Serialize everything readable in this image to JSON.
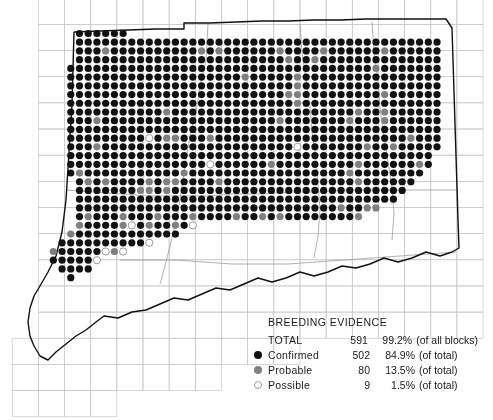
{
  "figure": {
    "kind": "distribution-dot-map",
    "region": "Connecticut",
    "colors": {
      "confirmed": "#111111",
      "probable": "#808080",
      "possible_fill": "#ffffff",
      "possible_stroke": "#9a9a9a",
      "block_grid": "#c9c9c9",
      "county_line": "#9d9d9d",
      "state_boundary": "#111111",
      "background": "#ffffff"
    },
    "geometry": {
      "dot_radius": 3.6,
      "dot_spacing_x": 8.72,
      "dot_spacing_y": 8.72,
      "dot_origin_x": 79.5,
      "dot_origin_y": 33.5,
      "block_size": 26.16,
      "block_origin_x": 38.0,
      "block_origin_y": 24.0,
      "block_cols": 17,
      "block_rows": 15
    }
  },
  "legend": {
    "title": "BREEDING EVIDENCE",
    "rows": [
      {
        "marker": "none",
        "label": "TOTAL",
        "count": "591",
        "percent": "99.2%",
        "note": "(of all blocks)"
      },
      {
        "marker": "confirmed",
        "label": "Confirmed",
        "count": "502",
        "percent": "84.9%",
        "note": "(of total)"
      },
      {
        "marker": "probable",
        "label": "Probable",
        "count": "80",
        "percent": "13.5%",
        "note": "(of total)"
      },
      {
        "marker": "possible",
        "label": "Possible",
        "count": "9",
        "percent": "1.5%",
        "note": "(of total)"
      }
    ]
  },
  "chart_data": {
    "type": "map",
    "title": "BREEDING EVIDENCE",
    "categories": [
      "Confirmed",
      "Probable",
      "Possible"
    ],
    "values": [
      502,
      80,
      9
    ],
    "percentages": [
      84.9,
      13.5,
      1.5
    ],
    "total_blocks_occupied": 591,
    "total_percent_of_all_blocks": 99.2,
    "legend_position": "bottom-right",
    "grid": true,
    "state_outline_path": [
      [
        74,
        32
      ],
      [
        100,
        31
      ],
      [
        128,
        30
      ],
      [
        156,
        29
      ],
      [
        184,
        29
      ],
      [
        184,
        23
      ],
      [
        210,
        23
      ],
      [
        236,
        22
      ],
      [
        262,
        21
      ],
      [
        288,
        21
      ],
      [
        314,
        20
      ],
      [
        340,
        20
      ],
      [
        366,
        19
      ],
      [
        392,
        19
      ],
      [
        420,
        19
      ],
      [
        446,
        19
      ],
      [
        452,
        28
      ],
      [
        453,
        60
      ],
      [
        454,
        92
      ],
      [
        455,
        124
      ],
      [
        456,
        156
      ],
      [
        457,
        188
      ],
      [
        458,
        220
      ],
      [
        459,
        248
      ],
      [
        452,
        252
      ],
      [
        440,
        256
      ],
      [
        426,
        252
      ],
      [
        412,
        258
      ],
      [
        398,
        262
      ],
      [
        384,
        258
      ],
      [
        370,
        264
      ],
      [
        356,
        268
      ],
      [
        342,
        266
      ],
      [
        328,
        272
      ],
      [
        314,
        276
      ],
      [
        300,
        272
      ],
      [
        286,
        278
      ],
      [
        272,
        282
      ],
      [
        258,
        278
      ],
      [
        244,
        284
      ],
      [
        230,
        290
      ],
      [
        216,
        288
      ],
      [
        202,
        294
      ],
      [
        188,
        300
      ],
      [
        174,
        298
      ],
      [
        160,
        304
      ],
      [
        146,
        310
      ],
      [
        132,
        312
      ],
      [
        118,
        318
      ],
      [
        104,
        316
      ],
      [
        96,
        322
      ],
      [
        86,
        330
      ],
      [
        76,
        336
      ],
      [
        66,
        344
      ],
      [
        56,
        352
      ],
      [
        48,
        360
      ],
      [
        40,
        356
      ],
      [
        34,
        346
      ],
      [
        30,
        336
      ],
      [
        28,
        322
      ],
      [
        30,
        308
      ],
      [
        34,
        296
      ],
      [
        40,
        286
      ],
      [
        48,
        272
      ],
      [
        56,
        256
      ],
      [
        62,
        232
      ],
      [
        66,
        200
      ],
      [
        68,
        168
      ],
      [
        70,
        136
      ],
      [
        72,
        104
      ],
      [
        73,
        68
      ],
      [
        74,
        32
      ]
    ],
    "dot_rows": [
      {
        "y": 0,
        "runs": [
          {
            "x": 0,
            "codes": "CCCCCC"
          }
        ]
      },
      {
        "y": 1,
        "runs": [
          {
            "x": 0,
            "codes": "CCCCCCCCCCCCCCCCCCCCCCCCCCCCCCCCCCCCCCCCCC"
          }
        ]
      },
      {
        "y": 2,
        "runs": [
          {
            "x": 0,
            "codes": "CCCPCCCCCCCCCCPCPCCCCCCPCCCCPCCCCCCPCCCCCC"
          }
        ]
      },
      {
        "y": 3,
        "runs": [
          {
            "x": 0,
            "codes": "CCCCCCCCCCCCCCCCCCCCCCCCPCCPCCCCCCCCCCCCCC"
          }
        ]
      },
      {
        "y": 4,
        "runs": [
          {
            "x": -1,
            "codes": "CCCCCCCCCCCCCCCCCCCCCCCCCCCCCCCCCCCPCCCCCCC"
          }
        ]
      },
      {
        "y": 5,
        "runs": [
          {
            "x": -1,
            "codes": "CCCCCCCCCCCCCCCCCCCCPCCCCCPCCCCCCCCCCCCCCCC"
          }
        ]
      },
      {
        "y": 6,
        "runs": [
          {
            "x": -1,
            "codes": "CCCCCCCCCCCCCCCCCCCCCCCCCCPCCCCCCCCCCCCCCCC"
          }
        ]
      },
      {
        "y": 7,
        "runs": [
          {
            "x": -1,
            "codes": "CCCCCCCCCCCCCCCCCCCCCCCCCPPCCCCCCCCCPCCCCCC"
          }
        ]
      },
      {
        "y": 8,
        "runs": [
          {
            "x": -1,
            "codes": "CCCCCCCCCCCCCCCCCCCCCCCCCCPCCCCCCCCCCCCCCCC"
          }
        ]
      },
      {
        "y": 9,
        "runs": [
          {
            "x": -1,
            "codes": "CCCCCCCCCCCPCCCCCCCCCCCCCCCCCCCCCPCCPCCCCCC"
          }
        ]
      },
      {
        "y": 10,
        "runs": [
          {
            "x": -1,
            "codes": "CCCPCCCCCCCCCCCCCCCCCCCCPCCCCCCCPCCCPCCCCCC"
          }
        ]
      },
      {
        "y": 11,
        "runs": [
          {
            "x": -1,
            "codes": "CCCCCCCCCCCCCCCCCCCCCCCCCCCCCCCCCCCCCCCCCCC"
          }
        ]
      },
      {
        "y": 12,
        "runs": [
          {
            "x": -1,
            "codes": "CCCCCCCCCOCPPCCCPCCCCCCCCCCCCCCCCCCCCCCPCCC"
          }
        ]
      },
      {
        "y": 13,
        "runs": [
          {
            "x": -1,
            "codes": "CCCPCCCCCCCCCCCCCCCCCCCCCCOCCCCCCCPCCPCCCCC"
          }
        ]
      },
      {
        "y": 14,
        "runs": [
          {
            "x": -1,
            "codes": "CCCCCCCCCCCCCCCCCCCCCCCCCCCCCCCCCCCCCCCCCC"
          }
        ]
      },
      {
        "y": 15,
        "runs": [
          {
            "x": -1,
            "codes": "CCCCCCCCCCCCCCCCOCCCCCCPCCCCCCCCCPCCCCCCPC"
          }
        ]
      },
      {
        "y": 16,
        "runs": [
          {
            "x": -1,
            "codes": "CPCCCCCCCCCCCPCCCCCCCCCCCCCCCCCCPCCCCCCCC"
          }
        ]
      },
      {
        "y": 17,
        "runs": [
          {
            "x": 0,
            "codes": "CPCPCCCCPCPPCCCCPCCCCCCCCCCCCCCCPCCCCCC"
          }
        ]
      },
      {
        "y": 18,
        "runs": [
          {
            "x": 0,
            "codes": "CCCCCCCPPCPCCCCCCCCCCCCCCCCCCCCCCCCCCC"
          }
        ]
      },
      {
        "y": 19,
        "runs": [
          {
            "x": 0,
            "codes": "CCCCCCCCCCCCCCCCCCCCCCCCCCCCCCCCCCCCC"
          }
        ]
      },
      {
        "y": 20,
        "runs": [
          {
            "x": 0,
            "codes": "CCCCCCCCCCCCCCCCCCCCCCCCCCCCCCPCCPP"
          }
        ]
      },
      {
        "y": 21,
        "runs": [
          {
            "x": 0,
            "codes": "CPCCCPCCCPCCCPCCCCPCCPCPCCCCCCCCP"
          }
        ]
      },
      {
        "y": 22,
        "runs": [
          {
            "x": 0,
            "codes": "PCCCCPOCPCCPCO"
          }
        ]
      },
      {
        "y": 23,
        "runs": [
          {
            "x": -1,
            "codes": "PCCCCCCCCCCCC"
          }
        ]
      },
      {
        "y": 24,
        "runs": [
          {
            "x": -2,
            "codes": "CCCCCCCCCCO"
          }
        ]
      },
      {
        "y": 25,
        "runs": [
          {
            "x": -3,
            "codes": "PCCCCCOPO"
          }
        ]
      },
      {
        "y": 26,
        "runs": [
          {
            "x": -3,
            "codes": "CCCCCO"
          }
        ]
      },
      {
        "y": 27,
        "runs": [
          {
            "x": -2,
            "codes": "CCCC"
          }
        ]
      },
      {
        "y": 28,
        "runs": [
          {
            "x": -1,
            "codes": "C"
          }
        ]
      }
    ],
    "county_lines": [
      [
        [
          208,
          24
        ],
        [
          206,
          60
        ],
        [
          200,
          86
        ],
        [
          196,
          112
        ],
        [
          190,
          136
        ],
        [
          186,
          160
        ],
        [
          182,
          186
        ],
        [
          178,
          212
        ],
        [
          172,
          238
        ],
        [
          166,
          262
        ],
        [
          160,
          284
        ]
      ],
      [
        [
          300,
          24
        ],
        [
          302,
          52
        ],
        [
          306,
          80
        ],
        [
          310,
          106
        ],
        [
          312,
          132
        ],
        [
          316,
          158
        ],
        [
          318,
          184
        ],
        [
          320,
          210
        ],
        [
          318,
          236
        ],
        [
          314,
          258
        ]
      ],
      [
        [
          372,
          22
        ],
        [
          374,
          52
        ],
        [
          378,
          80
        ],
        [
          380,
          108
        ],
        [
          384,
          136
        ],
        [
          388,
          162
        ],
        [
          392,
          188
        ],
        [
          394,
          214
        ],
        [
          392,
          240
        ]
      ],
      [
        [
          66,
          190
        ],
        [
          94,
          192
        ],
        [
          122,
          194
        ],
        [
          150,
          196
        ],
        [
          178,
          196
        ],
        [
          206,
          196
        ],
        [
          234,
          194
        ],
        [
          262,
          194
        ],
        [
          290,
          192
        ],
        [
          318,
          192
        ],
        [
          346,
          190
        ],
        [
          374,
          190
        ],
        [
          402,
          190
        ],
        [
          430,
          190
        ],
        [
          458,
          190
        ]
      ],
      [
        [
          120,
          260
        ],
        [
          148,
          260
        ],
        [
          176,
          260
        ],
        [
          204,
          262
        ],
        [
          232,
          264
        ],
        [
          260,
          264
        ],
        [
          288,
          264
        ],
        [
          316,
          262
        ],
        [
          344,
          260
        ],
        [
          372,
          258
        ],
        [
          400,
          256
        ],
        [
          428,
          254
        ],
        [
          456,
          252
        ]
      ]
    ]
  }
}
